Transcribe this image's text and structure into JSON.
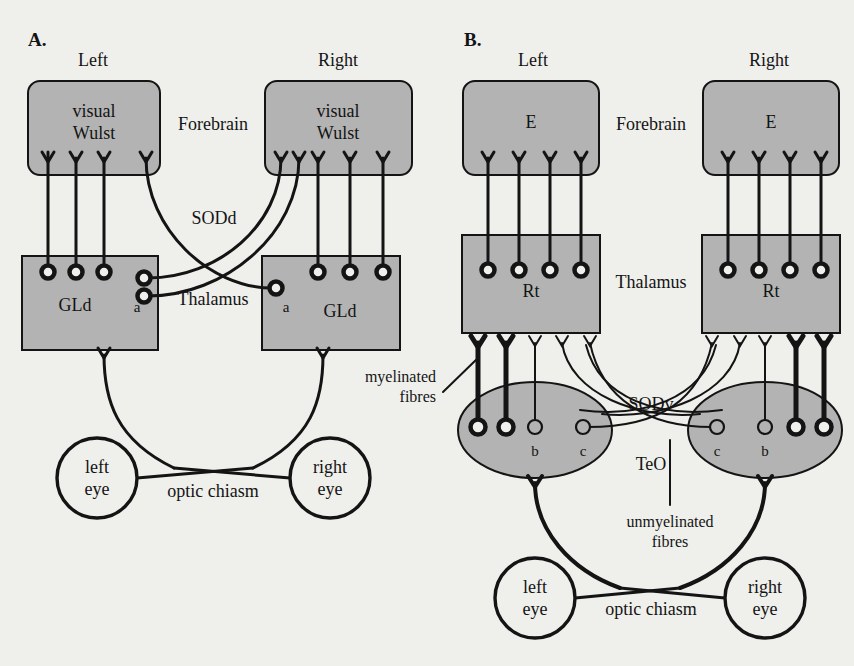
{
  "figure": {
    "type": "neuroanatomy-schematic",
    "background_color": "#efefec",
    "region_fill_color": "#b3b3b3",
    "line_color": "#141414"
  },
  "panels": [
    {
      "id": "A",
      "label": "A.",
      "pathway": "thalamofugal",
      "hemispheres": {
        "left": "Left",
        "right": "Right"
      },
      "level_labels": {
        "forebrain": "Forebrain",
        "thalamus": "Thalamus"
      },
      "forebrain_region": {
        "name": "visual Wulst",
        "line1": "visual",
        "line2": "Wulst"
      },
      "thalamic_region": {
        "name": "GLd"
      },
      "decussation": {
        "label": "SODd",
        "full_name": "supraoptic decussation dorsal"
      },
      "terminal_markers": {
        "a": "a"
      },
      "eyes": {
        "left": {
          "line1": "left",
          "line2": "eye"
        },
        "right": {
          "line1": "right",
          "line2": "eye"
        }
      },
      "chiasm_label": "optic chiasm"
    },
    {
      "id": "B",
      "label": "B.",
      "pathway": "tectofugal",
      "hemispheres": {
        "left": "Left",
        "right": "Right"
      },
      "level_labels": {
        "forebrain": "Forebrain",
        "thalamus": "Thalamus"
      },
      "forebrain_region": {
        "name": "E"
      },
      "thalamic_region": {
        "name": "Rt"
      },
      "tectal_region": {
        "name": "TeO"
      },
      "decussation": {
        "label": "SODv",
        "full_name": "supraoptic decussation ventral"
      },
      "terminal_markers": {
        "b": "b",
        "c": "c"
      },
      "fibre_annotations": {
        "myelinated": {
          "line1": "myelinated",
          "line2": "fibres"
        },
        "unmyelinated": {
          "line1": "unmyelinated",
          "line2": "fibres"
        }
      },
      "eyes": {
        "left": {
          "line1": "left",
          "line2": "eye"
        },
        "right": {
          "line1": "right",
          "line2": "eye"
        }
      },
      "chiasm_label": "optic chiasm"
    }
  ]
}
